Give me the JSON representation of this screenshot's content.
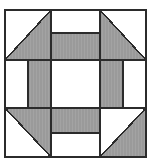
{
  "canvas": {
    "width": 152,
    "height": 166,
    "background_color": "#ffffff",
    "title": "Quilt Block Pattern"
  },
  "colors": {
    "fill_gray": "#9a9a9a",
    "fill_white": "#ffffff",
    "stroke_dark": "#2b2b2b",
    "stroke_mid": "#555555",
    "stripe_light": "#a3a3a3",
    "stripe_dark": "#929292"
  },
  "block": {
    "name": "nine-patch-pinwheel-block",
    "outer_square": {
      "x": 5,
      "y": 10,
      "width": 141,
      "height": 147
    },
    "grid": {
      "vertical_lines": [
        51,
        100
      ],
      "horizontal_lines": [
        60,
        108
      ],
      "columns": [
        {
          "from": 5,
          "to": 51
        },
        {
          "from": 51,
          "to": 100
        },
        {
          "from": 100,
          "to": 146
        }
      ],
      "rows": [
        {
          "from": 10,
          "to": 60
        },
        {
          "from": 60,
          "to": 108
        },
        {
          "from": 108,
          "to": 157
        }
      ]
    },
    "inner_square": {
      "x": 28,
      "y": 33,
      "width": 95,
      "height": 100
    },
    "stroke_width": 1.6
  },
  "shapes": [
    {
      "name": "corner-triangle-top-left",
      "type": "triangle",
      "fill": "#9a9a9a",
      "points": "5,10 51,10 51,60 5,60",
      "triangle_points": "5,60 51,10 51,60"
    },
    {
      "name": "corner-triangle-top-right",
      "type": "triangle",
      "fill": "#9a9a9a",
      "triangle_points": "100,10 100,60 146,60"
    },
    {
      "name": "corner-triangle-bottom-left",
      "type": "triangle",
      "fill": "#9a9a9a",
      "triangle_points": "5,108 51,108 51,157"
    },
    {
      "name": "corner-triangle-bottom-right",
      "type": "triangle",
      "fill": "#9a9a9a",
      "triangle_points": "146,108 146,157 100,157"
    },
    {
      "name": "edge-bar-top",
      "type": "rect",
      "fill": "#9a9a9a",
      "x": 51,
      "y": 33,
      "width": 49,
      "height": 27
    },
    {
      "name": "edge-bar-bottom",
      "type": "rect",
      "fill": "#9a9a9a",
      "x": 51,
      "y": 108,
      "width": 49,
      "height": 25
    },
    {
      "name": "edge-bar-left",
      "type": "rect",
      "fill": "#9a9a9a",
      "x": 28,
      "y": 60,
      "width": 23,
      "height": 48
    },
    {
      "name": "edge-bar-right",
      "type": "rect",
      "fill": "#9a9a9a",
      "x": 100,
      "y": 60,
      "width": 23,
      "height": 48
    },
    {
      "name": "center-square-white",
      "type": "rect",
      "fill": "#ffffff",
      "x": 51,
      "y": 60,
      "width": 49,
      "height": 48
    },
    {
      "name": "corner-square-top-left-white",
      "type": "rect",
      "fill": "#ffffff",
      "x": 5,
      "y": 60,
      "width": 23,
      "height": 48
    },
    {
      "name": "corner-square-top-right-white",
      "type": "rect",
      "fill": "#ffffff",
      "x": 123,
      "y": 60,
      "width": 23,
      "height": 48
    },
    {
      "name": "top-center-white",
      "type": "rect",
      "fill": "#ffffff",
      "x": 51,
      "y": 10,
      "width": 49,
      "height": 23
    },
    {
      "name": "bottom-center-white",
      "type": "rect",
      "fill": "#ffffff",
      "x": 51,
      "y": 133,
      "width": 49,
      "height": 24
    }
  ]
}
